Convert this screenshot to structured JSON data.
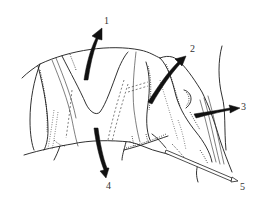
{
  "figure": {
    "type": "anatomical line drawing",
    "style": "black ink on white",
    "background_color": "#ffffff",
    "ink_color": "#1a1a1a"
  },
  "labels": [
    {
      "id": "1",
      "text": "1",
      "x": 104,
      "y": 16
    },
    {
      "id": "2",
      "text": "2",
      "x": 190,
      "y": 44
    },
    {
      "id": "3",
      "text": "3",
      "x": 241,
      "y": 102
    },
    {
      "id": "4",
      "text": "4",
      "x": 106,
      "y": 181
    },
    {
      "id": "5",
      "text": "5",
      "x": 240,
      "y": 182
    }
  ],
  "arrows": [
    {
      "id": "arrow-1",
      "label": "1",
      "direction": "up",
      "style": "solid black"
    },
    {
      "id": "arrow-2",
      "label": "2",
      "direction": "up-right",
      "style": "solid black"
    },
    {
      "id": "arrow-3",
      "label": "3",
      "direction": "right",
      "style": "solid black"
    },
    {
      "id": "arrow-4",
      "label": "4",
      "direction": "down",
      "style": "solid black"
    },
    {
      "id": "arrow-5",
      "label": "5",
      "direction": "down-right",
      "style": "hollow probe"
    }
  ]
}
